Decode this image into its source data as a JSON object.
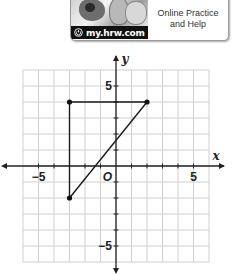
{
  "header": {
    "url": "my.hrw.com",
    "help_line1": "Online Practice",
    "help_line2": "and Help",
    "icons": [
      "power-icon",
      "header-illustration"
    ]
  },
  "graph": {
    "x_axis_label": "x",
    "y_axis_label": "y",
    "origin_label": "O",
    "x_tick_labels": {
      "neg": "−5",
      "pos": "5"
    },
    "y_tick_labels": {
      "neg": "−5",
      "pos": "5"
    },
    "x_range": [
      -6,
      6
    ],
    "y_range": [
      -6,
      6
    ],
    "grid": true,
    "points": [
      {
        "x": -3,
        "y": 4
      },
      {
        "x": 2,
        "y": 4
      },
      {
        "x": -3,
        "y": -2
      }
    ],
    "segments": [
      {
        "from": [
          -3,
          4
        ],
        "to": [
          2,
          4
        ]
      },
      {
        "from": [
          -3,
          4
        ],
        "to": [
          -3,
          -2
        ]
      },
      {
        "from": [
          -3,
          -2
        ],
        "to": [
          2,
          4
        ]
      }
    ]
  },
  "chart_data": {
    "type": "scatter",
    "title": "",
    "xlabel": "x",
    "ylabel": "y",
    "xlim": [
      -6,
      6
    ],
    "ylim": [
      -6,
      6
    ],
    "grid": true,
    "x_ticks_labeled": [
      -5,
      5
    ],
    "y_ticks_labeled": [
      -5,
      5
    ],
    "series": [
      {
        "name": "triangle",
        "x": [
          -3,
          2,
          -3
        ],
        "y": [
          4,
          4,
          -2
        ],
        "closed": true
      }
    ]
  }
}
